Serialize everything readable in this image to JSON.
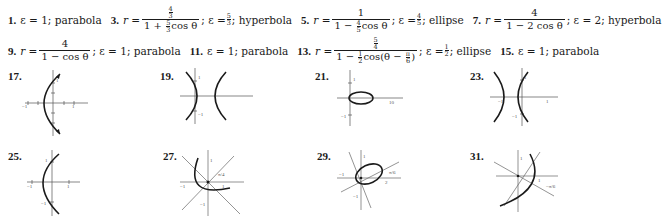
{
  "answers_row1": [
    {
      "num": "1.",
      "text": "ε = 1; parabola"
    },
    {
      "num": "3.",
      "lhs": "r =",
      "numer_top": "4",
      "numer_bot": "3",
      "denom_pre": "1 + ",
      "denom_frac_top": "5",
      "denom_frac_bot": "3",
      "denom_post": "cos θ",
      "tail_pre": "; ε = ",
      "ecc_top": "5",
      "ecc_bot": "3",
      "tail_post": "; hyperbola"
    },
    {
      "num": "5.",
      "lhs": "r =",
      "numer": "1",
      "denom_pre": "1 − ",
      "denom_frac_top": "4",
      "denom_frac_bot": "5",
      "denom_post": "cos θ",
      "tail_pre": "; ε = ",
      "ecc_top": "4",
      "ecc_bot": "5",
      "tail_post": "; ellipse"
    },
    {
      "num": "7.",
      "lhs": "r =",
      "numer": "4",
      "denom": "1 − 2 cos θ",
      "tail": "; ε = 2; hyperbola"
    }
  ],
  "answers_row2": [
    {
      "num": "9.",
      "lhs": "r =",
      "numer": "4",
      "denom": "1 − cos θ",
      "tail": "; ε = 1; parabola"
    },
    {
      "num": "11.",
      "text": "ε = 1; parabola"
    },
    {
      "num": "13.",
      "lhs": "r =",
      "numer_top": "5",
      "numer_bot": "4",
      "denom_pre": "1 − ",
      "denom_frac_top": "1",
      "denom_frac_bot": "2",
      "denom_mid": "cos(θ − ",
      "denom_ang_top": "π",
      "denom_ang_bot": "6",
      "denom_post": ")",
      "tail_pre": "; ε = ",
      "ecc_top": "1",
      "ecc_bot": "2",
      "tail_post": "; ellipse"
    },
    {
      "num": "15.",
      "text": "ε = 1; parabola"
    }
  ],
  "graphs": [
    {
      "label": "17.",
      "shape": "parabola-left-vertex",
      "ticks": {
        "x_neg": "−1",
        "x_pos": "1",
        "y_pos": "1"
      }
    },
    {
      "label": "19.",
      "shape": "hyperbola-horizontal",
      "ticks": {
        "y_pos": "1",
        "y_neg": "−1"
      }
    },
    {
      "label": "21.",
      "shape": "ellipse-horizontal",
      "ticks": {
        "y_pos": "1",
        "y_neg": "−1",
        "x_pos": "10"
      }
    },
    {
      "label": "23.",
      "shape": "hyperbola-horizontal-shifted",
      "ticks": {
        "x_neg": "−1",
        "x_pos": "1",
        "y_pos": "1",
        "y_neg": "−1"
      }
    },
    {
      "label": "25.",
      "shape": "parabola-left-vertex",
      "ticks": {
        "x_neg": "−1",
        "x_pos": "1",
        "y_pos": "1",
        "y_neg": "−1"
      }
    },
    {
      "label": "27.",
      "shape": "parabola-rotated",
      "ticks": {
        "x_neg": "−1",
        "x_pos": "1",
        "y_pos": "1",
        "y_neg": "−1",
        "angle": "π/4"
      }
    },
    {
      "label": "29.",
      "shape": "ellipse-rotated",
      "ticks": {
        "x_neg": "−1",
        "x_pos": "2",
        "y_pos": "1",
        "y_neg": "−1",
        "angle": "π/6"
      }
    },
    {
      "label": "31.",
      "shape": "parabola-rotated-neg",
      "ticks": {
        "y_pos": "1",
        "x_pos": "1",
        "angle": "−π/6"
      }
    }
  ]
}
